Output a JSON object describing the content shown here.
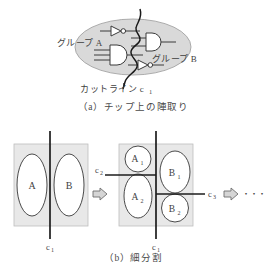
{
  "figure": {
    "panel_a": {
      "group_a_label": "グループ A",
      "group_b_label": "グループ B",
      "cutline_label": "カットライン c",
      "cutline_sub": "1",
      "caption": "（a）チップ上の陣取り",
      "gates": [
        {
          "name": "inverter-top",
          "type": "inverter"
        },
        {
          "name": "and-gate-left",
          "type": "and"
        },
        {
          "name": "and-gate-right",
          "type": "and"
        },
        {
          "name": "inverter-bottom",
          "type": "inverter"
        }
      ]
    },
    "panel_b": {
      "caption": "（b）細分割",
      "left_box": {
        "regions": [
          {
            "label": "A",
            "sub": ""
          },
          {
            "label": "B",
            "sub": ""
          }
        ],
        "cut_label": "c",
        "cut_sub": "1"
      },
      "right_box": {
        "regions": [
          {
            "label": "A",
            "sub": "1"
          },
          {
            "label": "A",
            "sub": "2"
          },
          {
            "label": "B",
            "sub": "1"
          },
          {
            "label": "B",
            "sub": "2"
          }
        ],
        "cut_label": "c",
        "cut_sub": "1",
        "cut2_label": "c",
        "cut2_sub": "2",
        "cut3_label": "c",
        "cut3_sub": "3"
      },
      "arrow": "⇨",
      "ellipsis": "・・・"
    },
    "colors": {
      "chip_fill": "#d9d9d9",
      "box_fill": "#e8e8e8",
      "stroke": "#555555",
      "line": "#303030",
      "text": "#3f3f3f",
      "arrow_fill": "#d0d0d0"
    }
  }
}
